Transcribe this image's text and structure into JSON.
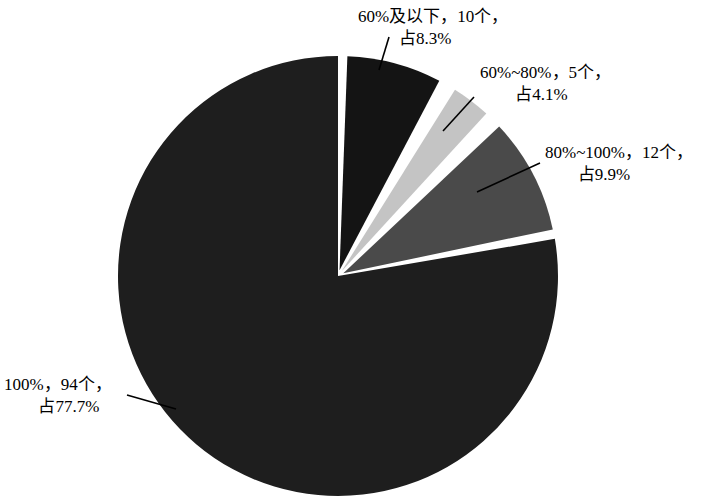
{
  "chart_data": {
    "type": "pie",
    "title": "",
    "subtitle": "",
    "xlabel": "",
    "ylabel": "",
    "legend_position": "none",
    "grid": false,
    "total_count": 121,
    "start_angle_deg": 0,
    "direction": "clockwise",
    "categories": [
      "60%及以下",
      "60%~80%",
      "80%~100%",
      "100%"
    ],
    "values": [
      8.3,
      4.1,
      9.9,
      77.7
    ],
    "counts": [
      10,
      5,
      12,
      94
    ],
    "colors": [
      "#141414",
      "#c4c4c4",
      "#4a4a4a",
      "#1e1e1e"
    ],
    "slices": [
      {
        "name": "60%及以下",
        "count": 10,
        "count_text": "10个",
        "percent": 8.3,
        "percent_text": "占8.3%",
        "color": "#141414",
        "label_line1": "60%及以下，10个，",
        "label_line2": "占8.3%",
        "exploded": true
      },
      {
        "name": "60%~80%",
        "count": 5,
        "count_text": "5个",
        "percent": 4.1,
        "percent_text": "占4.1%",
        "color": "#c4c4c4",
        "label_line1": "60%~80%，5个，",
        "label_line2": "占4.1%",
        "exploded": true
      },
      {
        "name": "80%~100%",
        "count": 12,
        "count_text": "12个",
        "percent": 9.9,
        "percent_text": "占9.9%",
        "color": "#4a4a4a",
        "label_line1": "80%~100%，12个，",
        "label_line2": "占9.9%",
        "exploded": true
      },
      {
        "name": "100%",
        "count": 94,
        "count_text": "94个",
        "percent": 77.7,
        "percent_text": "占77.7%",
        "color": "#1e1e1e",
        "label_line1": "100%，94个，",
        "label_line2": "占77.7%",
        "exploded": false
      }
    ]
  },
  "style": {
    "background": "#ffffff",
    "separator_color": "#ffffff",
    "leader_line_color": "#000000",
    "text_color": "#000000"
  }
}
